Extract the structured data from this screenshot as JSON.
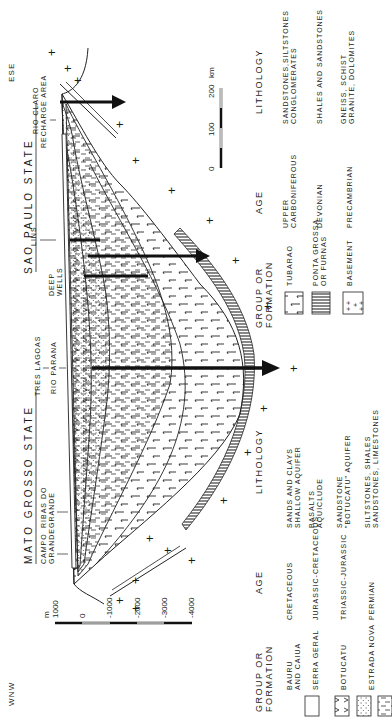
{
  "figure": {
    "direction_left": "WNW",
    "direction_right": "ESE",
    "states": [
      {
        "name": "MATO GROSSO STATE"
      },
      {
        "name": "SAO PAULO STATE"
      }
    ],
    "places": [
      {
        "line1": "CAMPO",
        "line2": "GRANDE"
      },
      {
        "line1": "RIBAS DO",
        "line2": "GRANDE"
      },
      {
        "line1": "TRES LAGOAS",
        "line2": ""
      },
      {
        "line1": "RIO PARANA",
        "line2": ""
      },
      {
        "line1": "DEEP",
        "line2": "WELLS"
      },
      {
        "line1": "LINS",
        "line2": ""
      },
      {
        "line1": "RIO CLARO",
        "line2": "RECHARGE AREA"
      }
    ],
    "depth_scale": {
      "unit": "m",
      "ticks": [
        "1000",
        "0",
        "-1000",
        "-2000",
        "-3000",
        "-4000"
      ]
    },
    "distance_scale": {
      "unit": "km",
      "ticks": [
        "0",
        "100",
        "200"
      ]
    }
  },
  "legend": {
    "headers": {
      "group": "GROUP OR FORMATION",
      "group_line1": "GROUP OR",
      "group_line2": "FORMATION",
      "age": "AGE",
      "lithology": "LITHOLOGY"
    },
    "left_entries": [
      {
        "pattern": "blank",
        "group_line1": "BAURU",
        "group_line2": "AND CAIUA",
        "age": "CRETACEOUS",
        "litho_line1": "SANDS  AND  CLAYS",
        "litho_line2": "SHALLOW  AQUIFER"
      },
      {
        "pattern": "basalt-v",
        "group_line1": "SERRA GERAL",
        "group_line2": "",
        "age": "JURASSIC-CRETACEOUS",
        "litho_line1": "BASALTS",
        "litho_line2": "AQUICLUDE"
      },
      {
        "pattern": "dots",
        "group_line1": "BOTUCATU",
        "group_line2": "",
        "age": "TRIASSIC-JURASSIC",
        "litho_line1": "SANDSTONE",
        "litho_line2": "\"BOTUCATU\" AQUIFER"
      },
      {
        "pattern": "dashes",
        "group_line1": "ESTRADA NOVA",
        "group_line2": "",
        "age": "PERMIAN",
        "litho_line1": "SILTSTONES,  SHALES",
        "litho_line2": "SANDSTONES, LIMESTONES"
      }
    ],
    "right_entries": [
      {
        "pattern": "tubarao",
        "group_line1": "TUBARAO",
        "group_line2": "",
        "age_line1": "UPPER",
        "age_line2": "CARBONIFEROUS",
        "litho_line1": "SANDSTONES,SILTSTONES",
        "litho_line2": "CONGLOMERATES"
      },
      {
        "pattern": "vertical-lines",
        "group_line1": "PONTA GROSSA",
        "group_line2": "OR FURNAS",
        "age_line1": "DEVONIAN",
        "age_line2": "",
        "litho_line1": "SHALES AND SANDSTONES",
        "litho_line2": ""
      },
      {
        "pattern": "crosses",
        "group_line1": "BASEMENT",
        "group_line2": "",
        "age_line1": "PRECAMBRIAN",
        "age_line2": "",
        "litho_line1": "GNEISS, SCHIST",
        "litho_line2": "GRANITE, DOLOMITES"
      }
    ]
  }
}
